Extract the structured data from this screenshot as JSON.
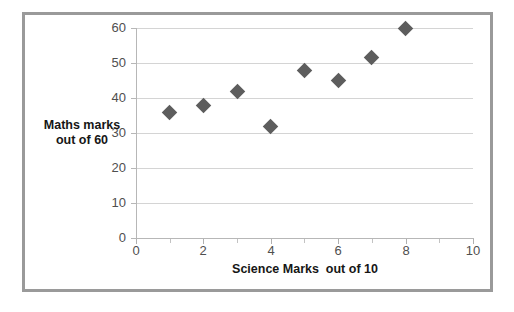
{
  "chart_data": {
    "type": "scatter",
    "title": "",
    "xlabel": "Science Marks  out of 10",
    "ylabel_line1": "Maths marks",
    "ylabel_line2": "out of 60",
    "x": [
      1,
      2,
      3,
      4,
      5,
      6,
      7,
      8
    ],
    "values": [
      36,
      38,
      42,
      32,
      48,
      45,
      51.5,
      60
    ],
    "points": [
      {
        "x": 1,
        "y": 36
      },
      {
        "x": 2,
        "y": 38
      },
      {
        "x": 3,
        "y": 42
      },
      {
        "x": 4,
        "y": 32
      },
      {
        "x": 5,
        "y": 48
      },
      {
        "x": 6,
        "y": 45
      },
      {
        "x": 7,
        "y": 51.5
      },
      {
        "x": 8,
        "y": 60
      }
    ],
    "xlim": [
      0,
      10
    ],
    "ylim": [
      0,
      60
    ],
    "xticks": [
      0,
      2,
      4,
      6,
      8,
      10
    ],
    "xtick_labels": [
      "0",
      "2",
      "4",
      "6",
      "8",
      "10"
    ],
    "xticks_minor": [
      1,
      3,
      5,
      7,
      9
    ],
    "yticks": [
      0,
      10,
      20,
      30,
      40,
      50,
      60
    ],
    "ytick_labels": [
      "0",
      "10",
      "20",
      "30",
      "40",
      "50",
      "60"
    ],
    "grid": "horizontal",
    "legend": "none",
    "marker": "diamond",
    "marker_color": "#5d5d5d",
    "gridline_color": "#d4d4d4",
    "axis_color": "#b7b7b7",
    "frame_color": "#9a9a9a",
    "background": "#ffffff"
  }
}
